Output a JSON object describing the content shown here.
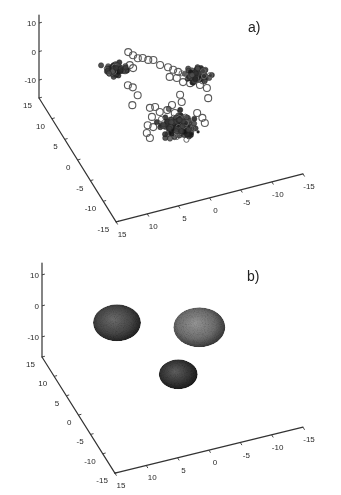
{
  "figure": {
    "panel_count": 2,
    "background": "#ffffff"
  },
  "chart_data": [
    {
      "panel_label": "a)",
      "type": "scatter",
      "dimensions": 3,
      "title": "",
      "xlabel": "",
      "ylabel": "",
      "zlabel": "",
      "xlim": [
        -15,
        15
      ],
      "ylim": [
        -15,
        15
      ],
      "zlim": [
        -16,
        13
      ],
      "xticks": [
        15,
        10,
        5,
        0,
        -5,
        -10,
        -15
      ],
      "yticks": [
        15,
        10,
        5,
        0,
        -5,
        -10,
        -15
      ],
      "zticks": [
        10,
        0,
        -10
      ],
      "grid": false,
      "legend": null,
      "series": [
        {
          "name": "scattered points",
          "marker": "open-circle",
          "color": "#5a5a5a",
          "points": [
            [
              2.7,
              10.1,
              0
            ],
            [
              2.3,
              9.2,
              0
            ],
            [
              1.9,
              8.3,
              0
            ],
            [
              1.2,
              8.1,
              0
            ],
            [
              0.6,
              7.4,
              0
            ],
            [
              -0.1,
              7.1,
              0
            ],
            [
              -0.6,
              5.7,
              0
            ],
            [
              -1.5,
              4.8,
              0
            ],
            [
              -2.0,
              4.0,
              0
            ],
            [
              -2.5,
              3.3,
              0
            ],
            [
              -0.9,
              2.7,
              0
            ],
            [
              -1.8,
              2.1,
              0
            ],
            [
              -2.3,
              0.9,
              0
            ],
            [
              -3.2,
              0.3,
              0
            ],
            [
              -4.4,
              -0.6,
              0
            ],
            [
              -5.1,
              -1.6,
              0
            ],
            [
              -4.4,
              -3.8,
              0
            ],
            [
              4.7,
              6.5,
              0
            ],
            [
              3.6,
              7.3,
              0
            ],
            [
              3.4,
              6.5,
              0
            ],
            [
              5.6,
              3.2,
              0
            ],
            [
              5.1,
              2.5,
              0
            ],
            [
              5.1,
              0.6,
              0
            ],
            [
              6.7,
              -1.2,
              0
            ],
            [
              4.5,
              -2.7,
              0
            ],
            [
              3.7,
              -2.8,
              0
            ],
            [
              3.5,
              -4.1,
              0
            ],
            [
              2.3,
              -4.1,
              0
            ],
            [
              1.2,
              -3.3,
              0
            ],
            [
              -0.8,
              -1.6,
              0
            ],
            [
              -0.4,
              -3.2,
              0
            ],
            [
              1.5,
              -5.1,
              0
            ],
            [
              5.0,
              -4.7,
              0
            ],
            [
              6.3,
              -6.2,
              0
            ],
            [
              5.7,
              -6.9,
              0
            ],
            [
              7.1,
              -7.8,
              0
            ],
            [
              7.1,
              -9.0,
              0
            ],
            [
              -1.6,
              -6.3,
              0
            ],
            [
              -1.9,
              -7.6,
              0
            ],
            [
              -1.8,
              -8.8,
              0
            ]
          ]
        },
        {
          "name": "dense clusters",
          "marker": "filled-circle",
          "color": "#222222",
          "clusters": [
            {
              "center": [
                6.1,
                7.1,
                0
              ],
              "sigma": 0.7,
              "n": 60,
              "seed": 11
            },
            {
              "center": [
                -4.9,
                1.6,
                0
              ],
              "sigma": 0.9,
              "n": 75,
              "seed": 23
            },
            {
              "center": [
                2.1,
                -7.8,
                0
              ],
              "sigma": 1.2,
              "n": 120,
              "seed": 37
            }
          ]
        },
        {
          "name": "outlier",
          "marker": "dot",
          "color": "#222222",
          "points": [
            [
              -0.1,
              -10.3,
              0
            ]
          ]
        }
      ]
    },
    {
      "panel_label": "b)",
      "type": "ellipsoid",
      "dimensions": 3,
      "title": "",
      "xlabel": "",
      "ylabel": "",
      "zlabel": "",
      "xlim": [
        -15,
        15
      ],
      "ylim": [
        -15,
        15
      ],
      "zlim": [
        -16,
        14
      ],
      "xticks": [
        15,
        10,
        5,
        0,
        -5,
        -10,
        -15
      ],
      "yticks": [
        15,
        10,
        5,
        0,
        -5,
        -10,
        -15
      ],
      "zticks": [
        10,
        0,
        -10
      ],
      "grid": false,
      "legend": null,
      "ellipsoids": [
        {
          "name": "cluster-1",
          "center": [
            6.1,
            7.1,
            0
          ],
          "radius": 3.7,
          "highlight": "#6c6c6c",
          "fill": "#454545",
          "edge": "#1b1b1b"
        },
        {
          "name": "cluster-2",
          "center": [
            -4.9,
            1.6,
            0
          ],
          "radius": 4.0,
          "highlight": "#959595",
          "fill": "#6d6d6d",
          "edge": "#2e2e2e"
        },
        {
          "name": "cluster-3",
          "center": [
            2.1,
            -7.8,
            0
          ],
          "radius": 3.0,
          "highlight": "#5f5f5f",
          "fill": "#353535",
          "edge": "#161616"
        }
      ]
    }
  ]
}
